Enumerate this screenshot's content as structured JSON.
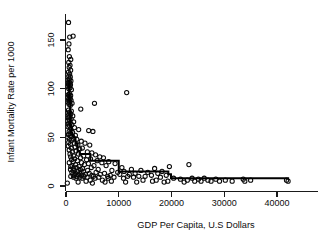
{
  "chart_data": {
    "type": "scatter",
    "title": "",
    "xlabel": "GDP Per Capita, U.S Dollars",
    "ylabel": "Infant Mortality Rate per 1000",
    "xlim": [
      -1500,
      43500
    ],
    "ylim": [
      -6,
      176
    ],
    "xticks": [
      0,
      10000,
      20000,
      30000,
      40000
    ],
    "xticklabels": [
      "0",
      "10000",
      "20000",
      "30000",
      "40000"
    ],
    "yticks": [
      0,
      50,
      100,
      150
    ],
    "yticklabels": [
      "0",
      "50",
      "100",
      "150"
    ],
    "grid": false,
    "legend": false,
    "marker": "open-circle",
    "marker_color": "#0a0a0a",
    "line_color": "#000000",
    "points": [
      [
        480,
        168
      ],
      [
        700,
        153
      ],
      [
        1350,
        154
      ],
      [
        560,
        146
      ],
      [
        420,
        140
      ],
      [
        640,
        133
      ],
      [
        900,
        130
      ],
      [
        520,
        127
      ],
      [
        760,
        124
      ],
      [
        600,
        122
      ],
      [
        880,
        119
      ],
      [
        470,
        117
      ],
      [
        690,
        115
      ],
      [
        520,
        113
      ],
      [
        810,
        112
      ],
      [
        640,
        110
      ],
      [
        400,
        109
      ],
      [
        930,
        108
      ],
      [
        560,
        107
      ],
      [
        720,
        106
      ],
      [
        470,
        105
      ],
      [
        850,
        104
      ],
      [
        610,
        103
      ],
      [
        380,
        102
      ],
      [
        760,
        101
      ],
      [
        540,
        100
      ],
      [
        1020,
        99
      ],
      [
        11500,
        96
      ],
      [
        660,
        95
      ],
      [
        450,
        94
      ],
      [
        880,
        93
      ],
      [
        600,
        92
      ],
      [
        340,
        91
      ],
      [
        790,
        90
      ],
      [
        520,
        89
      ],
      [
        960,
        88
      ],
      [
        690,
        87
      ],
      [
        410,
        86
      ],
      [
        1150,
        85
      ],
      [
        5400,
        85
      ],
      [
        580,
        84
      ],
      [
        830,
        83
      ],
      [
        2800,
        79
      ],
      [
        480,
        78
      ],
      [
        1010,
        77
      ],
      [
        660,
        76
      ],
      [
        370,
        75
      ],
      [
        900,
        74
      ],
      [
        550,
        73
      ],
      [
        1280,
        72
      ],
      [
        720,
        71
      ],
      [
        440,
        70
      ],
      [
        980,
        69
      ],
      [
        620,
        68
      ],
      [
        330,
        67
      ],
      [
        1450,
        66
      ],
      [
        800,
        65
      ],
      [
        510,
        64
      ],
      [
        1100,
        63
      ],
      [
        680,
        62
      ],
      [
        400,
        61
      ],
      [
        1600,
        60
      ],
      [
        870,
        59
      ],
      [
        2400,
        58
      ],
      [
        4300,
        57
      ],
      [
        5100,
        56
      ],
      [
        590,
        56
      ],
      [
        1250,
        55
      ],
      [
        760,
        54
      ],
      [
        470,
        53
      ],
      [
        1780,
        52
      ],
      [
        940,
        51
      ],
      [
        350,
        50
      ],
      [
        1380,
        49
      ],
      [
        2050,
        48
      ],
      [
        660,
        48
      ],
      [
        1120,
        47
      ],
      [
        2900,
        46
      ],
      [
        520,
        45
      ],
      [
        1550,
        44
      ],
      [
        3600,
        44
      ],
      [
        840,
        43
      ],
      [
        2250,
        42
      ],
      [
        4500,
        42
      ],
      [
        430,
        41
      ],
      [
        1700,
        40
      ],
      [
        1020,
        39
      ],
      [
        3100,
        39
      ],
      [
        2600,
        38
      ],
      [
        600,
        37
      ],
      [
        1900,
        36
      ],
      [
        1200,
        35
      ],
      [
        4050,
        35
      ],
      [
        4900,
        34
      ],
      [
        760,
        33
      ],
      [
        2350,
        33
      ],
      [
        5600,
        32
      ],
      [
        1450,
        31
      ],
      [
        3350,
        31
      ],
      [
        6400,
        30
      ],
      [
        890,
        30
      ],
      [
        2750,
        29
      ],
      [
        7100,
        29
      ],
      [
        1650,
        28
      ],
      [
        4650,
        28
      ],
      [
        1050,
        27
      ],
      [
        3900,
        27
      ],
      [
        5900,
        26
      ],
      [
        2150,
        26
      ],
      [
        8100,
        25
      ],
      [
        1380,
        25
      ],
      [
        6800,
        24
      ],
      [
        2950,
        24
      ],
      [
        620,
        24
      ],
      [
        4250,
        23
      ],
      [
        9300,
        23
      ],
      [
        1800,
        22
      ],
      [
        23300,
        22
      ],
      [
        3500,
        22
      ],
      [
        1150,
        21
      ],
      [
        5300,
        21
      ],
      [
        7600,
        21
      ],
      [
        2500,
        20
      ],
      [
        19600,
        20
      ],
      [
        900,
        20
      ],
      [
        4800,
        19
      ],
      [
        10600,
        19
      ],
      [
        1950,
        19
      ],
      [
        3150,
        18
      ],
      [
        16800,
        18
      ],
      [
        1400,
        18
      ],
      [
        6100,
        17
      ],
      [
        12400,
        17
      ],
      [
        2700,
        17
      ],
      [
        850,
        17
      ],
      [
        8700,
        16
      ],
      [
        4100,
        16
      ],
      [
        14200,
        16
      ],
      [
        1650,
        16
      ],
      [
        18200,
        15
      ],
      [
        3300,
        15
      ],
      [
        11000,
        15
      ],
      [
        2200,
        15
      ],
      [
        5700,
        14
      ],
      [
        9800,
        14
      ],
      [
        1100,
        14
      ],
      [
        15500,
        14
      ],
      [
        2850,
        14
      ],
      [
        7300,
        13
      ],
      [
        4400,
        13
      ],
      [
        13100,
        13
      ],
      [
        1800,
        13
      ],
      [
        17400,
        13
      ],
      [
        3700,
        12
      ],
      [
        6500,
        12
      ],
      [
        10200,
        12
      ],
      [
        2400,
        12
      ],
      [
        12000,
        12
      ],
      [
        1300,
        12
      ],
      [
        16200,
        11
      ],
      [
        4900,
        11
      ],
      [
        8400,
        11
      ],
      [
        2950,
        11
      ],
      [
        19000,
        11
      ],
      [
        1550,
        11
      ],
      [
        5200,
        10
      ],
      [
        11700,
        10
      ],
      [
        3400,
        10
      ],
      [
        7900,
        10
      ],
      [
        13800,
        10
      ],
      [
        2100,
        10
      ],
      [
        15000,
        10
      ],
      [
        900,
        10
      ],
      [
        6200,
        9
      ],
      [
        9100,
        9
      ],
      [
        4000,
        9
      ],
      [
        17900,
        9
      ],
      [
        2650,
        9
      ],
      [
        12800,
        9
      ],
      [
        1450,
        9
      ],
      [
        20400,
        8
      ],
      [
        23900,
        8
      ],
      [
        26200,
        8
      ],
      [
        5500,
        8
      ],
      [
        3050,
        8
      ],
      [
        10900,
        8
      ],
      [
        8000,
        8
      ],
      [
        1900,
        8
      ],
      [
        21700,
        7
      ],
      [
        25100,
        7
      ],
      [
        28400,
        7
      ],
      [
        33600,
        7
      ],
      [
        35000,
        6
      ],
      [
        26900,
        6
      ],
      [
        30200,
        6
      ],
      [
        23000,
        6
      ],
      [
        6900,
        6
      ],
      [
        4600,
        6
      ],
      [
        17100,
        6
      ],
      [
        14600,
        6
      ],
      [
        41800,
        6
      ],
      [
        42100,
        5
      ],
      [
        33900,
        5
      ],
      [
        29100,
        5
      ],
      [
        25600,
        5
      ],
      [
        31500,
        5
      ],
      [
        24400,
        5
      ],
      [
        27500,
        5
      ],
      [
        19300,
        5
      ],
      [
        16400,
        5
      ],
      [
        3800,
        5
      ],
      [
        8600,
        5
      ],
      [
        2300,
        4
      ],
      [
        11300,
        4
      ],
      [
        250,
        3
      ],
      [
        5000,
        3
      ],
      [
        13400,
        4
      ],
      [
        7400,
        4
      ],
      [
        22400,
        4
      ],
      [
        18600,
        4
      ]
    ],
    "step_line": [
      [
        300,
        108
      ],
      [
        600,
        88
      ],
      [
        800,
        62
      ],
      [
        1000,
        55
      ],
      [
        1200,
        52
      ],
      [
        1500,
        50
      ],
      [
        1800,
        44
      ],
      [
        2200,
        36
      ],
      [
        2600,
        33
      ],
      [
        3000,
        33
      ],
      [
        3400,
        33
      ],
      [
        3800,
        33
      ],
      [
        4200,
        33
      ],
      [
        4600,
        26
      ],
      [
        5200,
        26
      ],
      [
        5800,
        26
      ],
      [
        6400,
        26
      ],
      [
        7000,
        26
      ],
      [
        7600,
        26
      ],
      [
        8200,
        26
      ],
      [
        8800,
        26
      ],
      [
        9400,
        26
      ],
      [
        9900,
        26
      ],
      [
        10000,
        15
      ],
      [
        11000,
        15
      ],
      [
        12000,
        15
      ],
      [
        13000,
        15
      ],
      [
        14000,
        15
      ],
      [
        15000,
        15
      ],
      [
        16000,
        15
      ],
      [
        17000,
        15
      ],
      [
        18000,
        15
      ],
      [
        19000,
        15
      ],
      [
        19400,
        12
      ],
      [
        19700,
        12
      ],
      [
        19900,
        8
      ],
      [
        22000,
        8
      ],
      [
        25000,
        8
      ],
      [
        28000,
        8
      ],
      [
        31000,
        8
      ],
      [
        34000,
        8
      ],
      [
        37000,
        8
      ],
      [
        40000,
        8
      ],
      [
        42300,
        8
      ]
    ]
  },
  "axes": {
    "x_label": "GDP Per Capita, U.S Dollars",
    "y_label": "Infant Mortality Rate per 1000",
    "x_tick_labels": [
      "0",
      "10000",
      "20000",
      "30000",
      "40000"
    ],
    "y_tick_labels": [
      "0",
      "50",
      "100",
      "150"
    ]
  }
}
